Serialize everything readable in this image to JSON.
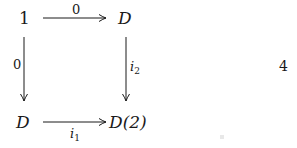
{
  "diagram": {
    "type": "commutative-square",
    "nodes": {
      "top_left": "1",
      "top_right": "D",
      "bottom_left": "D",
      "bottom_right": "D(2)"
    },
    "arrows": {
      "top": {
        "from": "1",
        "to": "D",
        "label": "0"
      },
      "left": {
        "from": "1",
        "to": "D",
        "label": "0"
      },
      "right": {
        "from": "D",
        "to": "D(2)",
        "label_base": "i",
        "label_sub": "2"
      },
      "bottom": {
        "from": "D",
        "to": "D(2)",
        "label_base": "i",
        "label_sub": "1"
      }
    },
    "equation_number": "4"
  },
  "colors": {
    "ink": "#1a1a1a",
    "background": "#ffffff"
  }
}
